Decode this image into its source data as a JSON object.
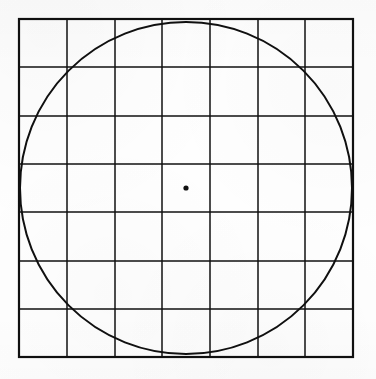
{
  "figure": {
    "title": "Square grid with inscribed circle and center point",
    "canvas": {
      "width": 376,
      "height": 379
    },
    "background_color": "#fefefe",
    "ink_color": "#101010"
  },
  "chart_data": {
    "type": "diagram",
    "title": "Square grid with inscribed circle and center point",
    "subtitle": "",
    "xlabel": "",
    "ylabel": "",
    "grid": true,
    "legend": false,
    "elements": [
      {
        "name": "outer-square",
        "shape": "rectangle",
        "x": 19,
        "y": 19,
        "width": 334,
        "height": 338,
        "stroke": "#101010",
        "stroke_width": 2.2,
        "fill": "none"
      },
      {
        "name": "grid",
        "shape": "grid",
        "columns": 7,
        "rows": 7,
        "cell_width": 47.7,
        "cell_height": 48.3,
        "vertical_lines_x": [
          19,
          67,
          115,
          162,
          210,
          258,
          305,
          353
        ],
        "horizontal_lines_y": [
          19,
          67,
          116,
          164,
          212,
          261,
          309,
          357
        ],
        "stroke": "#101010",
        "stroke_width": 1.5,
        "fill": "none"
      },
      {
        "name": "inscribed-circle",
        "shape": "circle",
        "cx": 186,
        "cy": 188,
        "r": 166,
        "stroke": "#101010",
        "stroke_width": 2.0,
        "fill": "none"
      },
      {
        "name": "center-point",
        "shape": "dot",
        "cx": 186,
        "cy": 188,
        "r": 2.6,
        "fill": "#101010",
        "stroke": "none"
      }
    ],
    "annotations": [],
    "xlim": [
      0,
      376
    ],
    "ylim": [
      0,
      379
    ]
  }
}
